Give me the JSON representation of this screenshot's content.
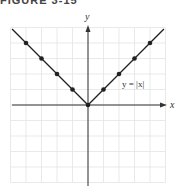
{
  "figure": {
    "title": "FIGURE 3-15"
  },
  "chart_data": {
    "type": "line",
    "title": "",
    "xlabel": "x",
    "ylabel": "y",
    "xlim": [
      -5,
      5
    ],
    "ylim": [
      -5,
      5
    ],
    "grid": true,
    "series": [
      {
        "name": "y = |x|",
        "x": [
          -4,
          -3,
          -2,
          -1,
          0,
          1,
          2,
          3,
          4
        ],
        "values": [
          4,
          3,
          2,
          1,
          0,
          1,
          2,
          3,
          4
        ]
      }
    ],
    "annotations": [
      {
        "text": "y = |x|",
        "x": 2.4,
        "y": 2
      }
    ],
    "colors": {
      "line": "#222222",
      "grid": "#e3e3e3",
      "axis": "#333333"
    }
  }
}
